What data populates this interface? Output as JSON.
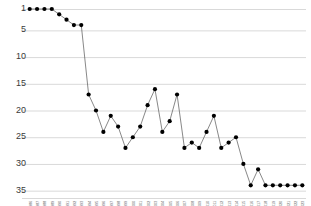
{
  "chart_data": {
    "type": "line",
    "title": "",
    "subtitle": "",
    "xlabel": "",
    "ylabel": "",
    "grid": true,
    "legend": false,
    "y_inverted": true,
    "ylim": [
      1,
      36
    ],
    "yticks": [
      1,
      5,
      10,
      15,
      20,
      25,
      30,
      35
    ],
    "ytick_labels": [
      "1",
      "5",
      "10",
      "15",
      "20",
      "25",
      "30",
      "35"
    ],
    "marker": "filled-circle",
    "marker_color": "#000000",
    "line_color": "#555555",
    "grid_color": "#d9d9d9",
    "categories": [
      "1986",
      "1987",
      "1988",
      "1989",
      "1990",
      "1991",
      "1992",
      "1993",
      "1994",
      "1995",
      "1996",
      "1997",
      "1998",
      "1999",
      "2000",
      "2001",
      "2002",
      "2003",
      "2004",
      "2005",
      "2006",
      "2007",
      "2008",
      "2009",
      "2010",
      "2011",
      "2012",
      "2013",
      "2014",
      "2015",
      "2016",
      "2017",
      "2018",
      "2019",
      "2020",
      "2021",
      "2022",
      "2023"
    ],
    "series": [
      {
        "name": "Rank",
        "values": [
          1,
          1,
          1,
          1,
          2,
          3,
          4,
          4,
          17,
          20,
          24,
          21,
          23,
          27,
          25,
          23,
          19,
          16,
          24,
          22,
          17,
          27,
          26,
          27,
          24,
          21,
          27,
          26,
          25,
          30,
          34,
          31,
          34,
          34,
          34,
          34,
          34,
          34
        ]
      }
    ],
    "annotations": []
  }
}
